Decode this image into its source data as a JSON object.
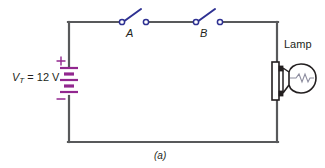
{
  "figure": {
    "caption": "(a)",
    "background_color": "#ffffff"
  },
  "colors": {
    "wire": "#58595b",
    "switch_blade": "#2e3192",
    "battery": "#92278f",
    "lamp_outline": "#231f20",
    "text": "#231f20"
  },
  "labels": {
    "switch_a": "A",
    "switch_b": "B",
    "lamp": "Lamp",
    "source_symbol": "V",
    "source_subscript": "T",
    "source_equals": " = 12 V",
    "source_full": "V_T = 12 V",
    "battery_plus": "+",
    "battery_minus": "−"
  },
  "circuit": {
    "type": "series-circuit",
    "source": {
      "name": "battery",
      "designator": "V_T",
      "voltage_value": 12,
      "voltage_unit": "V",
      "voltage_text": "12 V",
      "polarity_top": "+",
      "polarity_bottom": "−",
      "cells": 2
    },
    "components": [
      {
        "name": "switch-a",
        "label": "A",
        "type": "spst-switch",
        "state": "open"
      },
      {
        "name": "switch-b",
        "label": "B",
        "type": "spst-switch",
        "state": "open"
      },
      {
        "name": "lamp",
        "label": "Lamp",
        "type": "incandescent-lamp"
      }
    ],
    "loop_nodes": [
      "battery",
      "switch-a",
      "switch-b",
      "lamp"
    ]
  }
}
